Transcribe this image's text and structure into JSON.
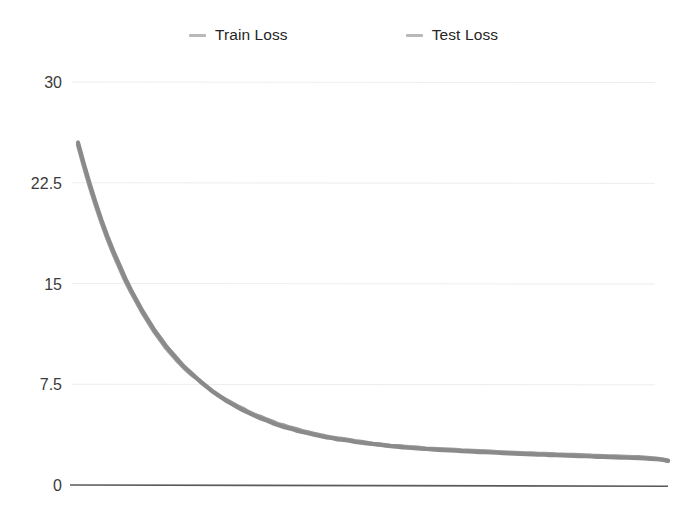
{
  "legend": {
    "position": "top-center",
    "items": [
      {
        "label": "Train Loss",
        "color": "#8c8c8c",
        "marker": "dash-marker-icon"
      },
      {
        "label": "Test Loss",
        "color": "#8a8a8a",
        "marker": "dash-marker-icon"
      }
    ]
  },
  "axis": {
    "y_ticks": [
      "30",
      "22.5",
      "15",
      "7.5",
      "0"
    ]
  },
  "colors": {
    "train_line": "#8c8c8c",
    "test_line": "#8a8a8a",
    "gridline": "#ededed",
    "baseline": "#5a5a5a",
    "tick_label": "#3b3b3b",
    "legend_label": "#262626",
    "background": "#ffffff"
  },
  "chart_data": {
    "type": "line",
    "title": "",
    "xlabel": "",
    "ylabel": "",
    "ylim": [
      0,
      30
    ],
    "xlim": [
      0,
      100
    ],
    "grid": true,
    "legend_position": "top-center",
    "yticks": [
      0,
      7.5,
      15,
      22.5,
      30
    ],
    "ytick_labels": [
      "0",
      "7.5",
      "15",
      "22.5",
      "30"
    ],
    "xtick_labels": [],
    "x": [
      0,
      1,
      2,
      3,
      4,
      5,
      6,
      7,
      8,
      9,
      10,
      11,
      12,
      13,
      14,
      15,
      16,
      17,
      18,
      19,
      20,
      21,
      22,
      23,
      24,
      25,
      26,
      27,
      28,
      29,
      30,
      31,
      32,
      33,
      34,
      35,
      36,
      37,
      38,
      39,
      40,
      41,
      42,
      43,
      44,
      45,
      46,
      47,
      48,
      49,
      50,
      51,
      52,
      53,
      54,
      55,
      56,
      57,
      58,
      59,
      60,
      61,
      62,
      63,
      64,
      65,
      66,
      67,
      68,
      69,
      70,
      71,
      72,
      73,
      74,
      75,
      76,
      77,
      78,
      79,
      80,
      81,
      82,
      83,
      84,
      85,
      86,
      87,
      88,
      89,
      90,
      91,
      92,
      93,
      94,
      95,
      96,
      97,
      98,
      99,
      100
    ],
    "series": [
      {
        "name": "Train Loss",
        "color": "#8c8c8c",
        "values": [
          25.5,
          23.9,
          22.4,
          21.0,
          19.7,
          18.5,
          17.4,
          16.4,
          15.4,
          14.5,
          13.7,
          12.9,
          12.2,
          11.5,
          10.9,
          10.3,
          9.8,
          9.3,
          8.8,
          8.4,
          8.0,
          7.6,
          7.25,
          6.9,
          6.6,
          6.3,
          6.05,
          5.8,
          5.55,
          5.35,
          5.15,
          4.95,
          4.8,
          4.6,
          4.45,
          4.3,
          4.2,
          4.05,
          3.95,
          3.85,
          3.75,
          3.65,
          3.55,
          3.5,
          3.4,
          3.35,
          3.3,
          3.2,
          3.15,
          3.1,
          3.05,
          3.0,
          2.95,
          2.9,
          2.85,
          2.8,
          2.78,
          2.75,
          2.7,
          2.68,
          2.65,
          2.62,
          2.6,
          2.58,
          2.55,
          2.52,
          2.5,
          2.48,
          2.45,
          2.44,
          2.42,
          2.4,
          2.38,
          2.36,
          2.34,
          2.32,
          2.3,
          2.28,
          2.26,
          2.25,
          2.23,
          2.22,
          2.2,
          2.18,
          2.17,
          2.15,
          2.14,
          2.12,
          2.1,
          2.09,
          2.07,
          2.06,
          2.04,
          2.03,
          2.01,
          2.0,
          1.98,
          1.95,
          1.92,
          1.88,
          1.8
        ]
      },
      {
        "name": "Test Loss",
        "color": "#8a8a8a",
        "values": [
          25.4,
          23.8,
          22.3,
          20.9,
          19.6,
          18.4,
          17.3,
          16.3,
          15.3,
          14.45,
          13.65,
          12.85,
          12.15,
          11.45,
          10.85,
          10.25,
          9.75,
          9.25,
          8.8,
          8.4,
          8.05,
          7.7,
          7.35,
          7.0,
          6.7,
          6.45,
          6.2,
          5.95,
          5.75,
          5.5,
          5.3,
          5.15,
          4.95,
          4.8,
          4.6,
          4.5,
          4.35,
          4.25,
          4.1,
          4.0,
          3.9,
          3.8,
          3.7,
          3.62,
          3.55,
          3.5,
          3.42,
          3.35,
          3.3,
          3.22,
          3.15,
          3.1,
          3.05,
          3.0,
          2.98,
          2.95,
          2.9,
          2.88,
          2.85,
          2.8,
          2.78,
          2.76,
          2.74,
          2.72,
          2.7,
          2.66,
          2.64,
          2.62,
          2.6,
          2.58,
          2.56,
          2.54,
          2.52,
          2.5,
          2.48,
          2.46,
          2.44,
          2.43,
          2.41,
          2.4,
          2.38,
          2.36,
          2.35,
          2.33,
          2.32,
          2.3,
          2.29,
          2.27,
          2.26,
          2.24,
          2.22,
          2.21,
          2.19,
          2.18,
          2.16,
          2.15,
          2.12,
          2.08,
          2.04,
          2.0,
          1.9
        ]
      }
    ]
  }
}
